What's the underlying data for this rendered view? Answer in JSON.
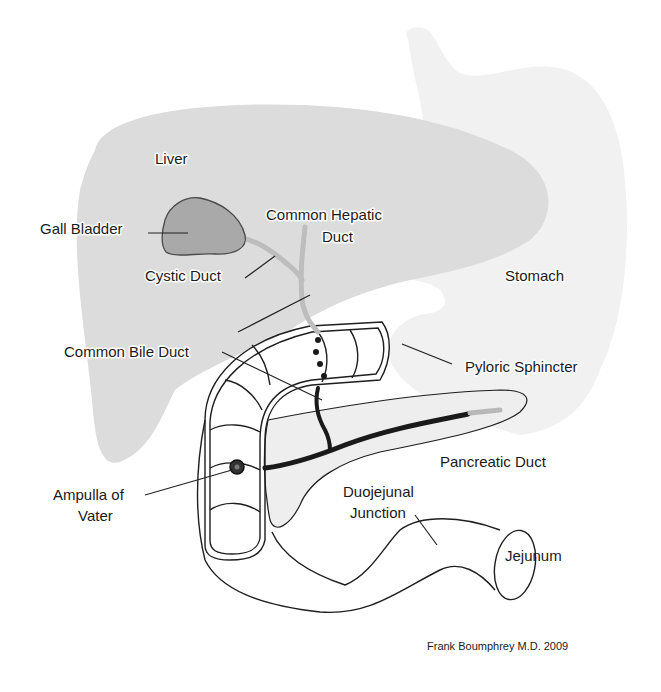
{
  "diagram": {
    "colors": {
      "stomach": "#f0f0f0",
      "liver": "#dcdcdc",
      "gall_bladder": "#a9a9a9",
      "bile_duct": "#bdbdbd",
      "pancreas": "#eeeeee",
      "duct_dark": "#1a1a1a",
      "duct_tail": "#b8b8b8"
    },
    "labels": {
      "liver": "Liver",
      "gall_bladder": "Gall Bladder",
      "common_hepatic_duct_line1": "Common Hepatic",
      "common_hepatic_duct_line2": "Duct",
      "cystic_duct": "Cystic Duct",
      "stomach": "Stomach",
      "common_bile_duct": "Common Bile Duct",
      "pyloric_sphincter": "Pyloric Sphincter",
      "pancreatic_duct": "Pancreatic Duct",
      "ampulla_line1": "Ampulla of",
      "ampulla_line2": "Vater",
      "duojejunal_line1": "Duojejunal",
      "duojejunal_line2": "Junction",
      "jejunum": "Jejunum"
    },
    "credit": "Frank Boumphrey M.D. 2009"
  }
}
